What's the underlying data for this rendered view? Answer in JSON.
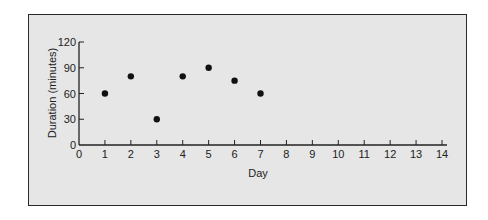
{
  "chart_data": {
    "type": "scatter",
    "title": "",
    "xlabel": "Day",
    "ylabel": "Duration (minutes)",
    "xlim": [
      0,
      14
    ],
    "ylim": [
      0,
      120
    ],
    "xticks": [
      0,
      1,
      2,
      3,
      4,
      5,
      6,
      7,
      8,
      9,
      10,
      11,
      12,
      13,
      14
    ],
    "yticks": [
      0,
      30,
      60,
      90,
      120
    ],
    "grid": false,
    "legend": null,
    "x": [
      1,
      2,
      3,
      4,
      5,
      6,
      7
    ],
    "y": [
      60,
      80,
      30,
      80,
      90,
      75,
      60
    ],
    "marker_color": "#111111",
    "background_color": "#e6e6e6"
  }
}
